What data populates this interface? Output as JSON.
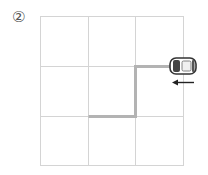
{
  "figure": {
    "label": "②",
    "grid": {
      "rows": 3,
      "cols": 3,
      "x": 40,
      "y": 16,
      "cell_w": 48,
      "cell_h": 50,
      "line_color": "#d4d4d4"
    },
    "path": {
      "color": "#b8b8b8",
      "description": "from car left one half cell, down one cell, left one cell"
    },
    "car": {
      "direction": "left"
    },
    "arrow": {
      "direction": "left"
    }
  }
}
